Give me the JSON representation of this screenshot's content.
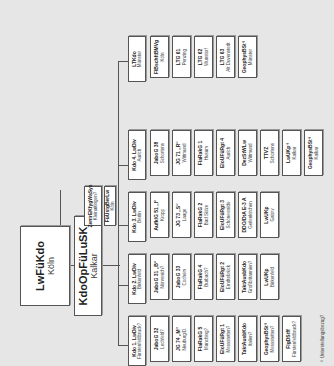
{
  "top": {
    "name": "LwFüKdo",
    "location": "Köln"
  },
  "op": {
    "name": "KdoOpFüLuSK",
    "location": "Kalkar"
  },
  "staff": [
    {
      "name": "ZentrEKfygWaSys",
      "location": "Kleinaitingen?"
    },
    {
      "name": "FüUstgBerLw",
      "location": "Köln"
    }
  ],
  "columns": [
    {
      "head": {
        "name": "Kdo 1. LwDiv",
        "location": "Fürstenfeldbruck?"
      },
      "units": [
        {
          "name": "JaboG 32",
          "location": "Lechfeld?"
        },
        {
          "name": "JG 74 „M“",
          "location": "Neuburg/D."
        },
        {
          "name": "FlaRakG 5",
          "location": "Manching?"
        },
        {
          "name": "EloUFüRgt 1",
          "location": "Messstetten?"
        },
        {
          "name": "TaktAusbKdo",
          "location": "Italien?"
        },
        {
          "name": "GeophysBSt¹⁾",
          "location": "Messstetten?"
        },
        {
          "name": "FlgDStff",
          "location": "Fürstenfeldbruck?"
        }
      ]
    },
    {
      "head": {
        "name": "Kdo 2. LwDiv",
        "location": "Birkenfeld"
      },
      "units": [
        {
          "name": "JaboG 31 „B“",
          "location": "Nörvenich?"
        },
        {
          "name": "JaboG 33",
          "location": "Cochem"
        },
        {
          "name": "FlaRakG 4",
          "location": "Burbach?"
        },
        {
          "name": "EloUFüRgt 2",
          "location": "Erndtebrück"
        },
        {
          "name": "TaktAusbKdo",
          "location": "Großbritannien?"
        },
        {
          "name": "LwUKp",
          "location": "Birkenfeld"
        }
      ]
    },
    {
      "head": {
        "name": "Kdo 3. LwDiv",
        "location": "Berlin"
      },
      "units": [
        {
          "name": "AufklG 51 „I“",
          "location": "Kropp"
        },
        {
          "name": "JG 73 „S“",
          "location": "Laage"
        },
        {
          "name": "FlaRakG 2",
          "location": "Bad Sülze"
        },
        {
          "name": "EloUFüRgt 3",
          "location": "Schönewalde"
        },
        {
          "name": "DDO/DtA E-3 A",
          "location": "Geilenkirchen"
        },
        {
          "name": "LwUKp",
          "location": "Gatow"
        }
      ]
    },
    {
      "head": {
        "name": "Kdo 4. LwDiv",
        "location": "Aurich"
      },
      "units": [
        {
          "name": "JaboG 38",
          "location": "Schortens"
        },
        {
          "name": "JG 71 „R“",
          "location": "Wittmund"
        },
        {
          "name": "FlaRakG 1",
          "location": "Husum"
        },
        {
          "name": "EloUFüRgt 4",
          "location": "Aurich"
        },
        {
          "name": "DezStWLw",
          "location": "Wittmund"
        },
        {
          "name": "TTVZ",
          "location": "Schortens"
        },
        {
          "name": "LwUKp¹⁾",
          "location": "Kalkar"
        },
        {
          "name": "GeophysBSt¹⁾",
          "location": "Kalkar"
        }
      ]
    },
    {
      "head": {
        "name": "LTKdo",
        "location": "Münster"
      },
      "units": [
        {
          "name": "FlBschftBMVg",
          "location": "Köln"
        },
        {
          "name": "LTG 61",
          "location": "Penzing"
        },
        {
          "name": "LTG 62",
          "location": "Wunstorf"
        },
        {
          "name": "LTG 63",
          "location": "Alt Duvenstedt"
        },
        {
          "name": "GeophysBSt¹⁾",
          "location": "Münster"
        }
      ]
    }
  ],
  "footnote": "¹⁾ Unterstellungsbezug?"
}
